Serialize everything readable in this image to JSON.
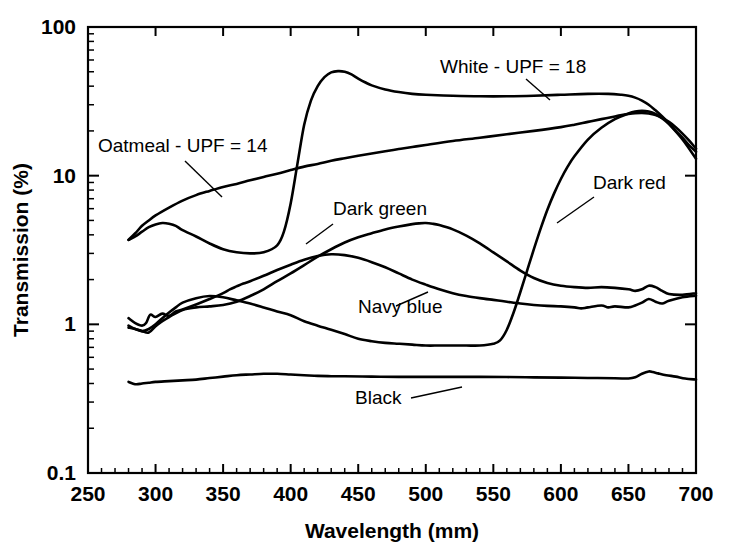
{
  "chart_data": {
    "type": "line",
    "title": "",
    "xlabel": "Wavelength (mm)",
    "ylabel": "Transmission (%)",
    "xlim": [
      250,
      700
    ],
    "ylim": [
      0.1,
      100
    ],
    "yscale": "log",
    "xscale": "linear",
    "grid": false,
    "legend_position": "inline-annotations",
    "xticks": [
      250,
      300,
      350,
      400,
      450,
      500,
      550,
      600,
      650,
      700
    ],
    "xticklabels": [
      "250",
      "300",
      "350",
      "400",
      "450",
      "500",
      "550",
      "600",
      "650",
      "700"
    ],
    "yticks": [
      0.1,
      1,
      10,
      100
    ],
    "yticklabels": [
      "0.1",
      "1",
      "10",
      "100"
    ],
    "series": [
      {
        "name": "White - UPF = 18",
        "label": "White - UPF = 18",
        "x": [
          280,
          285,
          290,
          295,
          300,
          305,
          310,
          315,
          320,
          330,
          340,
          350,
          360,
          370,
          380,
          390,
          395,
          400,
          405,
          410,
          415,
          420,
          425,
          430,
          435,
          440,
          445,
          450,
          455,
          460,
          470,
          480,
          490,
          500,
          520,
          540,
          560,
          580,
          600,
          620,
          635,
          645,
          650,
          655,
          660,
          665,
          670,
          675,
          680,
          685,
          690,
          695,
          700
        ],
        "y": [
          3.7,
          3.9,
          4.2,
          4.5,
          4.7,
          4.8,
          4.75,
          4.6,
          4.3,
          3.9,
          3.5,
          3.2,
          3.05,
          3.0,
          3.05,
          3.4,
          4.2,
          6.5,
          12.0,
          22.0,
          32.0,
          40.0,
          46.0,
          49.5,
          50.5,
          50.0,
          48.0,
          45.0,
          42.5,
          40.5,
          38.0,
          36.5,
          35.5,
          35.0,
          34.5,
          34.2,
          34.2,
          34.5,
          35.0,
          35.5,
          35.5,
          35.0,
          34.5,
          33.5,
          32.0,
          30.0,
          27.5,
          25.0,
          22.5,
          20.0,
          18.0,
          16.0,
          14.5
        ]
      },
      {
        "name": "Oatmeal - UPF = 14",
        "label": "Oatmeal - UPF = 14",
        "x": [
          280,
          285,
          290,
          295,
          300,
          310,
          320,
          330,
          340,
          350,
          360,
          370,
          380,
          390,
          400,
          410,
          420,
          430,
          440,
          450,
          460,
          470,
          480,
          490,
          500,
          520,
          540,
          560,
          580,
          600,
          610,
          620,
          630,
          640,
          645,
          650,
          655,
          660,
          665,
          670,
          675,
          680,
          685,
          690,
          695,
          700
        ],
        "y": [
          3.7,
          4.1,
          4.6,
          5.0,
          5.4,
          6.1,
          6.8,
          7.4,
          7.9,
          8.4,
          8.8,
          9.3,
          9.8,
          10.3,
          10.9,
          11.5,
          12.0,
          12.6,
          13.1,
          13.6,
          14.1,
          14.6,
          15.1,
          15.6,
          16.1,
          17.1,
          18.0,
          19.0,
          20.0,
          21.2,
          22.0,
          23.0,
          24.0,
          25.0,
          25.6,
          26.0,
          26.3,
          26.4,
          26.2,
          25.6,
          24.5,
          23.0,
          21.2,
          19.2,
          17.2,
          15.2
        ]
      },
      {
        "name": "Dark red",
        "label": "Dark red",
        "x": [
          280,
          285,
          290,
          295,
          300,
          305,
          310,
          315,
          320,
          330,
          340,
          350,
          360,
          370,
          380,
          390,
          400,
          410,
          420,
          430,
          440,
          450,
          460,
          470,
          480,
          490,
          500,
          510,
          520,
          530,
          540,
          550,
          555,
          560,
          565,
          570,
          575,
          580,
          585,
          590,
          595,
          600,
          605,
          610,
          620,
          630,
          640,
          650,
          655,
          660,
          665,
          670,
          675,
          680,
          690,
          700
        ],
        "y": [
          0.98,
          0.93,
          0.9,
          0.93,
          1.0,
          1.1,
          1.2,
          1.3,
          1.4,
          1.5,
          1.55,
          1.52,
          1.45,
          1.38,
          1.3,
          1.22,
          1.15,
          1.05,
          0.98,
          0.92,
          0.86,
          0.8,
          0.77,
          0.75,
          0.74,
          0.73,
          0.72,
          0.72,
          0.72,
          0.72,
          0.72,
          0.74,
          0.78,
          0.92,
          1.2,
          1.65,
          2.3,
          3.2,
          4.4,
          5.9,
          7.6,
          9.5,
          11.5,
          13.5,
          17.5,
          21.0,
          24.0,
          26.2,
          27.0,
          27.3,
          27.0,
          26.0,
          24.3,
          22.2,
          17.5,
          13.0
        ]
      },
      {
        "name": "Dark green",
        "label": "Dark green",
        "x": [
          280,
          285,
          290,
          295,
          300,
          305,
          310,
          320,
          330,
          340,
          350,
          360,
          370,
          380,
          390,
          400,
          410,
          420,
          430,
          440,
          450,
          460,
          470,
          480,
          490,
          495,
          500,
          505,
          510,
          520,
          530,
          540,
          550,
          560,
          570,
          580,
          590,
          600,
          610,
          620,
          630,
          640,
          650,
          655,
          660,
          665,
          670,
          675,
          680,
          690,
          700
        ],
        "y": [
          0.95,
          0.93,
          0.9,
          0.88,
          0.97,
          1.05,
          1.12,
          1.25,
          1.3,
          1.32,
          1.35,
          1.42,
          1.55,
          1.72,
          1.95,
          2.2,
          2.5,
          2.85,
          3.2,
          3.55,
          3.85,
          4.1,
          4.35,
          4.55,
          4.72,
          4.78,
          4.8,
          4.75,
          4.65,
          4.35,
          3.95,
          3.5,
          3.05,
          2.65,
          2.3,
          2.05,
          1.9,
          1.82,
          1.78,
          1.76,
          1.78,
          1.76,
          1.72,
          1.68,
          1.72,
          1.82,
          1.78,
          1.68,
          1.6,
          1.58,
          1.62
        ]
      },
      {
        "name": "Navy blue",
        "label": "Navy blue",
        "x": [
          280,
          285,
          290,
          293,
          296,
          300,
          305,
          310,
          315,
          320,
          330,
          340,
          350,
          355,
          360,
          365,
          370,
          380,
          390,
          400,
          410,
          420,
          430,
          440,
          450,
          460,
          470,
          480,
          490,
          500,
          510,
          520,
          530,
          540,
          550,
          555,
          560,
          570,
          580,
          590,
          600,
          610,
          615,
          620,
          630,
          635,
          640,
          650,
          655,
          660,
          665,
          670,
          675,
          680,
          690,
          700
        ],
        "y": [
          1.1,
          1.02,
          0.98,
          1.02,
          1.16,
          1.12,
          1.18,
          1.14,
          1.22,
          1.26,
          1.36,
          1.48,
          1.62,
          1.72,
          1.8,
          1.88,
          1.95,
          2.12,
          2.32,
          2.52,
          2.72,
          2.88,
          2.96,
          2.92,
          2.8,
          2.62,
          2.42,
          2.2,
          2.0,
          1.85,
          1.72,
          1.62,
          1.55,
          1.5,
          1.46,
          1.44,
          1.42,
          1.38,
          1.35,
          1.33,
          1.32,
          1.3,
          1.28,
          1.3,
          1.34,
          1.3,
          1.32,
          1.3,
          1.34,
          1.4,
          1.48,
          1.42,
          1.38,
          1.44,
          1.52,
          1.56
        ]
      },
      {
        "name": "Black",
        "label": "Black",
        "x": [
          280,
          283,
          286,
          290,
          295,
          300,
          310,
          320,
          330,
          340,
          350,
          360,
          370,
          380,
          390,
          400,
          410,
          420,
          430,
          440,
          460,
          480,
          500,
          520,
          540,
          560,
          580,
          600,
          620,
          640,
          650,
          655,
          660,
          665,
          668,
          672,
          678,
          685,
          692,
          700
        ],
        "y": [
          0.41,
          0.4,
          0.395,
          0.4,
          0.405,
          0.41,
          0.415,
          0.42,
          0.425,
          0.435,
          0.445,
          0.455,
          0.46,
          0.465,
          0.465,
          0.46,
          0.455,
          0.45,
          0.448,
          0.447,
          0.445,
          0.443,
          0.443,
          0.443,
          0.443,
          0.442,
          0.44,
          0.438,
          0.436,
          0.434,
          0.432,
          0.44,
          0.465,
          0.482,
          0.478,
          0.468,
          0.455,
          0.445,
          0.432,
          0.425
        ]
      }
    ],
    "annotations": [
      {
        "name": "oatmeal-annotation",
        "text": "Oatmeal - UPF = 14",
        "text_x": 98,
        "text_y": 152,
        "leader": [
          [
            185,
            161
          ],
          [
            222,
            197
          ]
        ]
      },
      {
        "name": "white-annotation",
        "text": "White - UPF = 18",
        "text_x": 440,
        "text_y": 73,
        "leader": [
          [
            526,
            79
          ],
          [
            550,
            100
          ]
        ]
      },
      {
        "name": "dark-red-annotation",
        "text": "Dark red",
        "text_x": 593,
        "text_y": 189,
        "leader": [
          [
            594,
            197
          ],
          [
            557,
            223
          ]
        ]
      },
      {
        "name": "dark-green-annotation",
        "text": "Dark green",
        "text_x": 333,
        "text_y": 215,
        "leader": [
          [
            333,
            224
          ],
          [
            306,
            244
          ]
        ]
      },
      {
        "name": "navy-blue-annotation",
        "text": "Navy blue",
        "text_x": 358,
        "text_y": 313,
        "leader": [
          [
            396,
            306
          ],
          [
            428,
            292
          ]
        ]
      },
      {
        "name": "black-annotation",
        "text": "Black",
        "text_x": 355,
        "text_y": 404,
        "leader": [
          [
            411,
            398
          ],
          [
            462,
            387
          ]
        ]
      }
    ]
  },
  "colors": {
    "curve": "#000000",
    "axis": "#000000",
    "background": "#ffffff"
  }
}
